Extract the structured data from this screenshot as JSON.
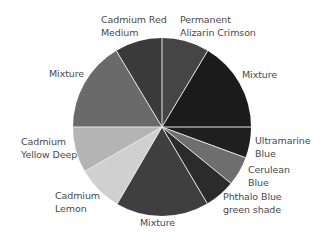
{
  "chart_data": {
    "type": "pie",
    "title": "",
    "start_angle_deg": 0,
    "direction": "clockwise",
    "center": [
      162,
      127
    ],
    "radius": 89,
    "separator_color": "#e8e8e8",
    "slices": [
      {
        "label": "Permanent Alizarin Crimson",
        "lines": [
          "Permanent",
          "Alizarin Crimson"
        ],
        "value": 8.6,
        "color": "#454545",
        "label_pos": [
          180,
          13
        ]
      },
      {
        "label": "Mixture",
        "lines": [
          "Mixture"
        ],
        "value": 16.4,
        "color": "#1b1b1b",
        "label_pos": [
          242,
          68
        ]
      },
      {
        "label": "Ultramarine Blue",
        "lines": [
          "Ultramarine",
          "Blue"
        ],
        "value": 5.6,
        "color": "#1f1f1f",
        "label_pos": [
          255,
          134
        ]
      },
      {
        "label": "Cerulean Blue",
        "lines": [
          "Cerulean",
          "Blue"
        ],
        "value": 5.3,
        "color": "#6e6e6e",
        "label_pos": [
          248,
          163
        ]
      },
      {
        "label": "Phthalo Blue green shade",
        "lines": [
          "Phthalo Blue",
          "green shade"
        ],
        "value": 5.6,
        "color": "#2b2b2b",
        "label_pos": [
          223,
          190
        ]
      },
      {
        "label": "Mixture",
        "lines": [
          "Mixture"
        ],
        "value": 16.9,
        "color": "#3f3f3f",
        "label_pos": [
          140,
          216
        ]
      },
      {
        "label": "Cadmium Lemon",
        "lines": [
          "Cadmium",
          "Lemon"
        ],
        "value": 8.3,
        "color": "#d0d0d0",
        "label_pos": [
          55,
          189
        ]
      },
      {
        "label": "Cadmium Yellow Deep",
        "lines": [
          "Cadmium",
          "Yellow Deep"
        ],
        "value": 8.3,
        "color": "#b4b4b4",
        "label_pos": [
          21,
          135
        ]
      },
      {
        "label": "Mixture",
        "lines": [
          "Mixture"
        ],
        "value": 16.4,
        "color": "#6a6a6a",
        "label_pos": [
          49,
          67
        ]
      },
      {
        "label": "Cadmium Red Medium",
        "lines": [
          "Cadmium Red",
          "Medium"
        ],
        "value": 8.6,
        "color": "#3a3a3a",
        "label_pos": [
          101,
          13
        ]
      }
    ],
    "legend": "none (direct labels)"
  }
}
